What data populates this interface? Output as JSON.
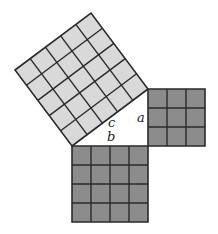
{
  "diagram": {
    "type": "pythagorean-theorem",
    "unit_px": 19,
    "origin": {
      "x": 72,
      "y": 146
    },
    "right_angle_vertex": {
      "x": 148,
      "y": 146
    },
    "colors": {
      "hypotenuse_square_fill": "#d9d9d9",
      "leg_square_fill": "#8c8c8c",
      "grid_line": "#2a2a2a",
      "triangle_fill": "#ffffff"
    },
    "squares": [
      {
        "name": "square-c",
        "side_units": 5,
        "cells": 25,
        "label": "c"
      },
      {
        "name": "square-a",
        "side_units": 3,
        "cells": 9,
        "label": "a"
      },
      {
        "name": "square-b",
        "side_units": 4,
        "cells": 16,
        "label": "b"
      }
    ],
    "labels": {
      "a": "a",
      "b": "b",
      "c": "c"
    }
  }
}
